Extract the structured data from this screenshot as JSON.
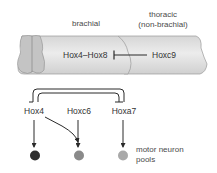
{
  "region_labels": {
    "brachial": "brachial",
    "thoracic_line1": "thoracic",
    "thoracic_line2": "(non-brachial)"
  },
  "spinal_cord": {
    "inner_gene": "Hox4–Hox8",
    "repressor_gene": "Hoxc9",
    "relation": "Hoxc9 represses Hox4–Hox8"
  },
  "network": {
    "genes": [
      {
        "id": "hox4",
        "label": "Hox4"
      },
      {
        "id": "hoxc6",
        "label": "Hoxc6"
      },
      {
        "id": "hoxa7",
        "label": "Hoxa7"
      }
    ],
    "interactions": [
      {
        "from": "Hox4",
        "to": "Hoxa7",
        "type": "repression"
      },
      {
        "from": "Hoxa7",
        "to": "Hox4",
        "type": "repression"
      },
      {
        "from": "Hox4",
        "to": "Hoxc6-output",
        "type": "activation"
      },
      {
        "from": "Hox4",
        "to": "pool-1",
        "type": "activation"
      },
      {
        "from": "Hoxc6",
        "to": "pool-2",
        "type": "activation"
      },
      {
        "from": "Hoxa7",
        "to": "pool-3",
        "type": "activation"
      }
    ],
    "pools": [
      {
        "color": "#2e2e2e"
      },
      {
        "color": "#8a8a8a"
      },
      {
        "color": "#a9a9a9"
      }
    ],
    "pools_label_line1": "motor neuron",
    "pools_label_line2": "pools"
  },
  "colors": {
    "cord_fill": "#e4e4e4",
    "cord_stroke": "#9a9a9a",
    "gray_matter": "#c4c4c4",
    "line": "#2a2a2a"
  }
}
